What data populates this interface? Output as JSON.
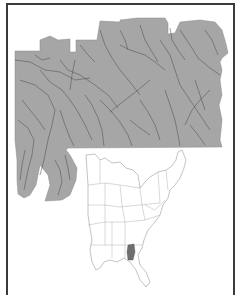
{
  "map": {
    "type": "watershed-location-map",
    "main_region": {
      "fill_color": "#a6a6a6",
      "stream_color": "#4a4a4a"
    },
    "inset_map": {
      "region": "Eastern United States",
      "state_fill": "#ffffff",
      "state_stroke": "#9a9a9a",
      "highlight_fill": "#6e6e6e"
    },
    "frame_color": "#3a3a3a",
    "background": "#ffffff"
  }
}
